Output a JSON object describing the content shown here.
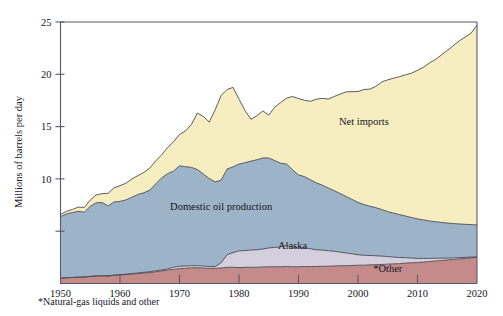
{
  "chart_data": {
    "type": "area",
    "title": "",
    "subtitle": "",
    "xlabel": "",
    "ylabel": "Millions of barrels per day",
    "xlim": [
      1950,
      2020
    ],
    "ylim": [
      0,
      25
    ],
    "grid": false,
    "stacked": true,
    "legend_position": "inline-annotations",
    "x_ticks": [
      "1950",
      "1960",
      "1970",
      "1980",
      "1990",
      "2000",
      "2010",
      "2020"
    ],
    "x_tick_values": [
      1950,
      1960,
      1970,
      1980,
      1990,
      2000,
      2010,
      2020
    ],
    "y_ticks": [
      "",
      "10",
      "15",
      "20",
      "25"
    ],
    "y_tick_values": [
      5,
      10,
      15,
      20,
      25
    ],
    "footnote": "*Natural-gas liquids and other",
    "x": [
      1950,
      1951,
      1952,
      1953,
      1954,
      1955,
      1956,
      1957,
      1958,
      1959,
      1960,
      1961,
      1962,
      1963,
      1964,
      1965,
      1966,
      1967,
      1968,
      1969,
      1970,
      1971,
      1972,
      1973,
      1974,
      1975,
      1976,
      1977,
      1978,
      1979,
      1980,
      1981,
      1982,
      1983,
      1984,
      1985,
      1986,
      1987,
      1988,
      1989,
      1990,
      1991,
      1992,
      1993,
      1994,
      1995,
      1996,
      1997,
      1998,
      1999,
      2000,
      2001,
      2002,
      2003,
      2004,
      2005,
      2006,
      2007,
      2008,
      2009,
      2010,
      2011,
      2012,
      2013,
      2014,
      2015,
      2016,
      2017,
      2018,
      2019,
      2020
    ],
    "series": [
      {
        "name": "*Other",
        "color": "#c58b8b",
        "values": [
          0.5,
          0.55,
          0.58,
          0.6,
          0.62,
          0.68,
          0.72,
          0.74,
          0.72,
          0.78,
          0.82,
          0.85,
          0.9,
          0.95,
          1.0,
          1.05,
          1.12,
          1.2,
          1.28,
          1.35,
          1.42,
          1.45,
          1.5,
          1.5,
          1.48,
          1.45,
          1.45,
          1.48,
          1.55,
          1.55,
          1.52,
          1.55,
          1.55,
          1.55,
          1.58,
          1.6,
          1.6,
          1.6,
          1.62,
          1.6,
          1.6,
          1.62,
          1.62,
          1.62,
          1.65,
          1.65,
          1.68,
          1.7,
          1.7,
          1.72,
          1.75,
          1.75,
          1.78,
          1.8,
          1.82,
          1.85,
          1.88,
          1.9,
          1.95,
          1.98,
          2.0,
          2.05,
          2.1,
          2.15,
          2.2,
          2.25,
          2.3,
          2.35,
          2.4,
          2.45,
          2.5
        ]
      },
      {
        "name": "Alaska",
        "color": "#d4cfdd",
        "values": [
          0.0,
          0.0,
          0.0,
          0.0,
          0.0,
          0.0,
          0.0,
          0.0,
          0.0,
          0.02,
          0.03,
          0.04,
          0.05,
          0.06,
          0.07,
          0.08,
          0.1,
          0.1,
          0.12,
          0.2,
          0.23,
          0.22,
          0.2,
          0.2,
          0.19,
          0.18,
          0.17,
          0.5,
          1.2,
          1.4,
          1.6,
          1.6,
          1.65,
          1.68,
          1.72,
          1.8,
          1.85,
          1.9,
          2.0,
          1.88,
          1.78,
          1.8,
          1.7,
          1.6,
          1.55,
          1.48,
          1.4,
          1.3,
          1.22,
          1.12,
          1.0,
          0.95,
          0.9,
          0.85,
          0.8,
          0.72,
          0.65,
          0.58,
          0.52,
          0.45,
          0.4,
          0.35,
          0.3,
          0.26,
          0.22,
          0.18,
          0.15,
          0.12,
          0.1,
          0.08,
          0.05
        ]
      },
      {
        "name": "Domestic oil production",
        "color": "#9db4c8",
        "values": [
          5.9,
          6.1,
          6.2,
          6.3,
          6.2,
          6.7,
          7.0,
          7.0,
          6.7,
          7.0,
          7.0,
          7.1,
          7.3,
          7.5,
          7.6,
          7.8,
          8.3,
          8.8,
          9.1,
          9.2,
          9.6,
          9.5,
          9.4,
          9.2,
          8.8,
          8.4,
          8.1,
          7.9,
          8.2,
          8.2,
          8.3,
          8.4,
          8.5,
          8.6,
          8.7,
          8.6,
          8.3,
          8.0,
          7.8,
          7.4,
          7.0,
          6.8,
          6.6,
          6.4,
          6.2,
          6.0,
          5.8,
          5.6,
          5.4,
          5.2,
          5.0,
          4.85,
          4.7,
          4.6,
          4.45,
          4.3,
          4.2,
          4.1,
          3.98,
          3.88,
          3.78,
          3.68,
          3.58,
          3.5,
          3.42,
          3.35,
          3.28,
          3.22,
          3.16,
          3.1,
          3.05
        ]
      },
      {
        "name": "Net imports",
        "color": "#f6eec0",
        "values": [
          0.2,
          0.25,
          0.3,
          0.4,
          0.45,
          0.6,
          0.75,
          0.85,
          1.2,
          1.35,
          1.5,
          1.6,
          1.75,
          1.8,
          1.95,
          2.1,
          2.2,
          2.2,
          2.5,
          2.8,
          3.0,
          3.4,
          4.1,
          5.4,
          5.5,
          5.4,
          6.9,
          8.1,
          7.6,
          7.6,
          6.2,
          5.0,
          4.0,
          4.2,
          4.5,
          4.1,
          5.1,
          5.8,
          6.3,
          7.0,
          7.3,
          7.3,
          7.5,
          8.0,
          8.3,
          8.5,
          9.0,
          9.5,
          10.0,
          10.3,
          10.6,
          11.0,
          11.2,
          11.6,
          12.2,
          12.6,
          12.9,
          13.2,
          13.5,
          13.8,
          14.2,
          14.6,
          15.1,
          15.5,
          16.0,
          16.5,
          17.0,
          17.5,
          17.9,
          18.3,
          19.1
        ]
      }
    ],
    "total_top": [
      6.6,
      6.9,
      7.08,
      7.3,
      7.27,
      7.98,
      8.47,
      8.59,
      8.62,
      9.15,
      9.35,
      9.59,
      10.0,
      10.25,
      10.62,
      11.03,
      11.92,
      12.3,
      13.0,
      13.55,
      14.25,
      14.57,
      15.2,
      16.3,
      15.97,
      15.43,
      16.62,
      17.98,
      18.55,
      18.75,
      17.62,
      16.55,
      15.7,
      16.03,
      16.5,
      16.1,
      16.85,
      17.3,
      17.72,
      17.88,
      17.68,
      17.52,
      17.42,
      17.62,
      17.7,
      17.63,
      17.88,
      18.1,
      18.32,
      18.34,
      18.35,
      18.55,
      18.58,
      18.85,
      19.27,
      19.47,
      19.63,
      19.78,
      19.95,
      20.11,
      20.38,
      20.68,
      21.08,
      21.41,
      21.84,
      22.28,
      22.73,
      23.19,
      23.56,
      23.93,
      24.7
    ],
    "annotations": [
      {
        "text": "Net imports",
        "x": 2001,
        "y": 15.2
      },
      {
        "text": "Domestic oil production",
        "x": 1977,
        "y": 7.0
      },
      {
        "text": "Alaska",
        "x": 1989,
        "y": 3.3
      },
      {
        "text": "*Other",
        "x": 2005,
        "y": 1.1
      }
    ]
  },
  "axes": {
    "y_axis_title": "Millions of barrels per day",
    "y_labels": [
      "25",
      "20",
      "15",
      "10"
    ],
    "x_labels": [
      "1950",
      "1960",
      "1970",
      "1980",
      "1990",
      "2000",
      "2010",
      "2020"
    ]
  },
  "labels": {
    "net_imports": "Net imports",
    "domestic": "Domestic oil production",
    "alaska": "Alaska",
    "other": "*Other",
    "footnote": "*Natural-gas liquids and other"
  },
  "colors": {
    "net_imports": "#f6eec0",
    "domestic": "#9db4c8",
    "alaska": "#d4cfdd",
    "other": "#c58b8b",
    "outline": "#4a4a52",
    "axis": "#5a5a66",
    "background": "#ffffff"
  }
}
